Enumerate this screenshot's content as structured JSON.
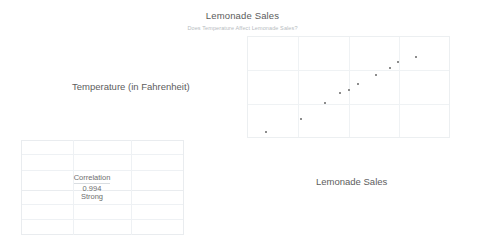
{
  "chart_data": {
    "type": "scatter",
    "title": "Lemonade Sales",
    "subtitle": "Does Temperature Affect Lemonade Sales?",
    "xlabel": "Lemonade Sales",
    "ylabel": "Temperature (in Fahrenheit)",
    "grid": true,
    "legend": false,
    "xlim": [
      0,
      10
    ],
    "ylim": [
      0,
      10
    ],
    "points": [
      {
        "x": 0.9,
        "y": 0.5
      },
      {
        "x": 2.65,
        "y": 1.85
      },
      {
        "x": 3.85,
        "y": 3.45
      },
      {
        "x": 4.6,
        "y": 4.45
      },
      {
        "x": 5.0,
        "y": 4.75
      },
      {
        "x": 5.45,
        "y": 5.35
      },
      {
        "x": 6.35,
        "y": 6.2
      },
      {
        "x": 7.05,
        "y": 6.95
      },
      {
        "x": 7.45,
        "y": 7.5
      },
      {
        "x": 8.35,
        "y": 8.05
      }
    ],
    "point_color": "#8d8d8d"
  },
  "worksheet": {
    "correlation": {
      "label": "Correlation",
      "value": "0.994",
      "strength": "Strong"
    }
  },
  "colors": {
    "grid": "#eff2f4",
    "plot_border": "#eceff1",
    "title_text": "#5b5b5b",
    "subtitle_text": "#b7bcc1",
    "label_text": "#5d5d5d",
    "sheet_grid": "#e9ecef"
  }
}
